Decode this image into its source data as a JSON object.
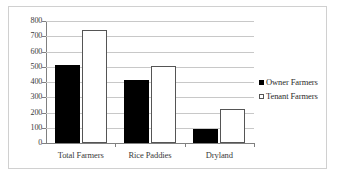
{
  "chart_data": {
    "type": "bar",
    "title": "",
    "xlabel": "",
    "ylabel": "",
    "ylim": [
      0,
      800
    ],
    "y_ticks": [
      0,
      100,
      200,
      300,
      400,
      500,
      600,
      700,
      800
    ],
    "grid": true,
    "legend_position": "right",
    "categories": [
      "Total Farmers",
      "Rice Paddies",
      "Dryland"
    ],
    "series": [
      {
        "name": "Owner Farmers",
        "marker": "filled-square",
        "color": "#000000",
        "values": [
          510,
          410,
          95
        ]
      },
      {
        "name": "Tenant Farmers",
        "marker": "open-square",
        "color": "#ffffff",
        "values": [
          740,
          505,
          225
        ]
      }
    ]
  },
  "axis": {
    "tick_labels": [
      "800",
      "700",
      "600",
      "500",
      "400",
      "300",
      "200",
      "100",
      "0"
    ]
  },
  "legend": {
    "entries": [
      {
        "label": "Owner Farmers"
      },
      {
        "label": "Tenant Farmers"
      }
    ]
  }
}
